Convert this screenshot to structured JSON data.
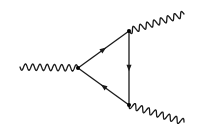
{
  "diagram": {
    "type": "feynman-diagram",
    "colors": {
      "line": "#1a1a1a",
      "vertex": "#000000",
      "background": "#ffffff"
    },
    "vertices": [
      {
        "id": "v-left",
        "x": 78,
        "y": 68
      },
      {
        "id": "v-top",
        "x": 129,
        "y": 31
      },
      {
        "id": "v-bottom",
        "x": 129,
        "y": 105
      }
    ],
    "internal_lines": [
      {
        "id": "edge-left-top",
        "from": "v-left",
        "to": "v-top",
        "style": "fermion",
        "arrow": "toward v-top"
      },
      {
        "id": "edge-top-bottom",
        "from": "v-top",
        "to": "v-bottom",
        "style": "fermion",
        "arrow": "toward v-bottom"
      },
      {
        "id": "edge-bottom-left",
        "from": "v-bottom",
        "to": "v-left",
        "style": "fermion",
        "arrow": "toward v-left"
      }
    ],
    "external_lines": [
      {
        "id": "boson-left",
        "from": [
          20,
          67
        ],
        "to": "v-left",
        "style": "wavy",
        "cycles": 8
      },
      {
        "id": "boson-top-right",
        "from": "v-top",
        "to": [
          184,
          14
        ],
        "style": "wavy",
        "cycles": 8
      },
      {
        "id": "boson-bottom-right",
        "from": "v-bottom",
        "to": [
          184,
          122
        ],
        "style": "wavy",
        "cycles": 8
      }
    ]
  }
}
